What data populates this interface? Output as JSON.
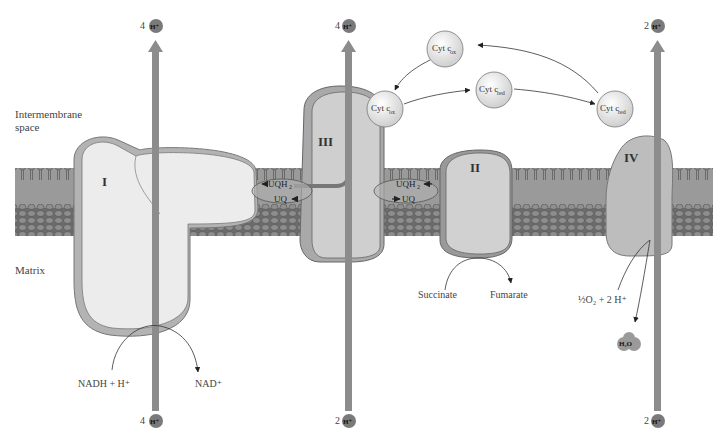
{
  "diagram": {
    "regions": {
      "intermembrane_line1": "Intermembrane",
      "intermembrane_line2": "space",
      "matrix": "Matrix"
    },
    "complexes": [
      {
        "id": "I",
        "label": "I"
      },
      {
        "id": "III",
        "label": "III"
      },
      {
        "id": "II",
        "label": "II"
      },
      {
        "id": "IV",
        "label": "IV"
      }
    ],
    "proton_pumps": {
      "complex_I_top": {
        "count": "4",
        "ion": "H⁺"
      },
      "complex_I_bottom": {
        "count": "4",
        "ion": "H⁺"
      },
      "complex_III_top": {
        "count": "4",
        "ion": "H⁺"
      },
      "complex_III_bottom": {
        "count": "2",
        "ion": "H⁺"
      },
      "complex_IV_top": {
        "count": "2",
        "ion": "H⁺"
      },
      "complex_IV_bottom": {
        "count": "2",
        "ion": "H⁺"
      }
    },
    "cytochromes": {
      "cyt_top": {
        "base": "Cyt c",
        "sub": "ox"
      },
      "cyt_left": {
        "base": "Cyt c",
        "sub": "ox"
      },
      "cyt_mid": {
        "base": "Cyt c",
        "sub": "red"
      },
      "cyt_right": {
        "base": "Cyt c",
        "sub": "red"
      }
    },
    "ubiquinone_pools": {
      "pool1": {
        "top": "UQH",
        "top_sub": "2",
        "bottom": "UQ"
      },
      "pool2": {
        "top": "UQH",
        "top_sub": "2",
        "bottom": "UQ"
      }
    },
    "reactions": {
      "nadh": "NADH + H⁺",
      "nad": "NAD⁺",
      "succinate": "Succinate",
      "fumarate": "Fumarate",
      "oxygen": "½O₂ + 2 H⁺",
      "water": "H₂O"
    },
    "colors": {
      "membrane": "#8a8a8a",
      "complex_fill_light": "#ececec",
      "complex_fill_mid": "#c8c8c8",
      "complex_rim": "#a6a6a6",
      "proton_arrow": "#8c8c8c",
      "proton_ball": "#7a7a7a"
    }
  }
}
